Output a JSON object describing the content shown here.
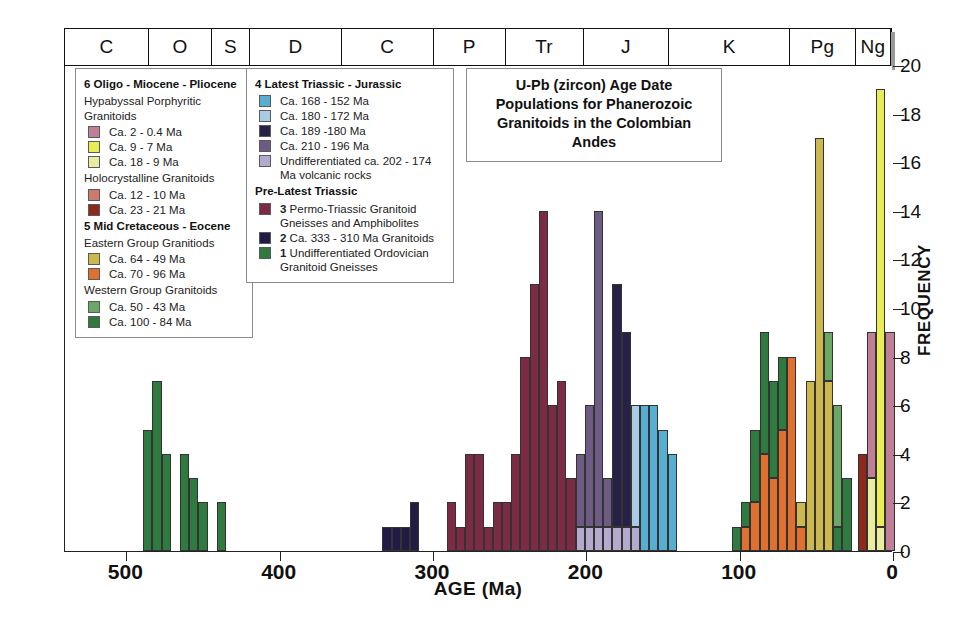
{
  "title": "U-Pb (zircon) Age Date Populations for Phanerozoic Granitoids in the Colombian Andes",
  "axis": {
    "xlabel": "AGE (Ma)",
    "ylabel": "FREQUENCY",
    "xticks": [
      500,
      400,
      300,
      200,
      100,
      0
    ],
    "yticks": [
      0,
      2,
      4,
      6,
      8,
      10,
      12,
      14,
      16,
      18,
      20
    ],
    "xlim": [
      540,
      0
    ],
    "ylim": [
      0,
      20
    ]
  },
  "timescale": {
    "periods": [
      {
        "label": "C",
        "start": 541,
        "end": 485
      },
      {
        "label": "O",
        "start": 485,
        "end": 444
      },
      {
        "label": "S",
        "start": 444,
        "end": 419
      },
      {
        "label": "D",
        "start": 419,
        "end": 359
      },
      {
        "label": "C",
        "start": 359,
        "end": 299
      },
      {
        "label": "P",
        "start": 299,
        "end": 252
      },
      {
        "label": "Tr",
        "start": 252,
        "end": 201
      },
      {
        "label": "J",
        "start": 201,
        "end": 145
      },
      {
        "label": "K",
        "start": 145,
        "end": 66
      },
      {
        "label": "Pg",
        "start": 66,
        "end": 23
      },
      {
        "label": "Ng",
        "start": 23,
        "end": 0
      }
    ]
  },
  "colors": {
    "pink_mauve": "#c07f96",
    "yellow_bright": "#e8ec55",
    "yellow_pale": "#e9eda0",
    "salmon": "#cc7a6c",
    "dark_red": "#8e2a1c",
    "khaki": "#ccb84e",
    "orange": "#e0702f",
    "green_light": "#6aa866",
    "green_dark": "#2f7a3e",
    "blue_mid": "#57aed0",
    "blue_pale": "#a9cbe4",
    "navy_dark": "#272148",
    "purple_mid": "#6e5b83",
    "lavender": "#b4aacd",
    "maroon": "#7d2a44",
    "navy_deep": "#211b45",
    "green_forest": "#2f7a3e"
  },
  "legend_left": {
    "groups": [
      {
        "head": "6 Oligo - Miocene - Pliocene",
        "subgroups": [
          {
            "sub": "Hypabyssal Porphyritic Granitoids",
            "items": [
              {
                "label": "Ca. 2 - 0.4 Ma",
                "color": "#c07f96"
              },
              {
                "label": "Ca. 9 - 7 Ma",
                "color": "#e8ec55"
              },
              {
                "label": "Ca. 18 - 9 Ma",
                "color": "#e9eda0"
              }
            ]
          },
          {
            "sub": "Holocrystalline Granitoids",
            "items": [
              {
                "label": "Ca. 12 - 10 Ma",
                "color": "#cc7a6c"
              },
              {
                "label": "Ca. 23 - 21 Ma",
                "color": "#8e2a1c"
              }
            ]
          }
        ]
      },
      {
        "head": "5 Mid Cretaceous - Eocene",
        "subgroups": [
          {
            "sub": "Eastern Group Granitiods",
            "items": [
              {
                "label": "Ca. 64 - 49 Ma",
                "color": "#ccb84e"
              },
              {
                "label": "Ca. 70 - 96 Ma",
                "color": "#e0702f"
              }
            ]
          },
          {
            "sub": "Western Group Granitoids",
            "items": [
              {
                "label": "Ca. 50 - 43 Ma",
                "color": "#6aa866"
              },
              {
                "label": "Ca. 100 - 84 Ma",
                "color": "#2f7a3e"
              }
            ]
          }
        ]
      }
    ]
  },
  "legend_right": {
    "groups": [
      {
        "head": "4 Latest Triassic - Jurassic",
        "subgroups": [
          {
            "sub": "",
            "items": [
              {
                "label": "Ca. 168 - 152 Ma",
                "color": "#57aed0"
              },
              {
                "label": "Ca. 180 - 172 Ma",
                "color": "#a9cbe4"
              },
              {
                "label": "Ca. 189 -180 Ma",
                "color": "#272148"
              },
              {
                "label": "Ca. 210 - 196 Ma",
                "color": "#6e5b83"
              },
              {
                "label": "Undifferentiated ca. 202 - 174 Ma volcanic rocks",
                "color": "#b4aacd"
              }
            ]
          }
        ]
      },
      {
        "head": "Pre-Latest Triassic",
        "subgroups": [
          {
            "sub": "",
            "items": [
              {
                "label": "3 Permo-Triassic Granitoid Gneisses and Amphibolites",
                "color": "#7d2a44",
                "num": "3"
              },
              {
                "label": "2 Ca. 333 - 310 Ma Granitoids",
                "color": "#211b45",
                "num": "2"
              },
              {
                "label": "1 Undifferentiated Ordovician Granitoid Gneisses",
                "color": "#2f7a3e",
                "num": "1"
              }
            ]
          }
        ]
      }
    ]
  },
  "chart_data": {
    "type": "bar",
    "title": "U-Pb (zircon) Age Date Populations for Phanerozoic Granitoids in the Colombian Andes",
    "xlabel": "AGE (Ma)",
    "ylabel": "FREQUENCY",
    "xlim": [
      540,
      0
    ],
    "ylim": [
      0,
      20
    ],
    "grid": false,
    "orientation": "x-reversed",
    "bin_width_ma": 6,
    "legend_position": "inside-upper-left",
    "note": "Stacked histogram; each bar is one age bin with colored segments by granitoid population.",
    "bars": [
      {
        "age": 486,
        "segments": [
          {
            "color": "#2f7a3e",
            "value": 5
          }
        ]
      },
      {
        "age": 480,
        "segments": [
          {
            "color": "#2f7a3e",
            "value": 7
          }
        ]
      },
      {
        "age": 474,
        "segments": [
          {
            "color": "#2f7a3e",
            "value": 4
          }
        ]
      },
      {
        "age": 462,
        "segments": [
          {
            "color": "#2f7a3e",
            "value": 4
          }
        ]
      },
      {
        "age": 456,
        "segments": [
          {
            "color": "#2f7a3e",
            "value": 3
          }
        ]
      },
      {
        "age": 450,
        "segments": [
          {
            "color": "#2f7a3e",
            "value": 2
          }
        ]
      },
      {
        "age": 438,
        "segments": [
          {
            "color": "#2f7a3e",
            "value": 2
          }
        ]
      },
      {
        "age": 330,
        "segments": [
          {
            "color": "#211b45",
            "value": 1
          }
        ]
      },
      {
        "age": 324,
        "segments": [
          {
            "color": "#211b45",
            "value": 1
          }
        ]
      },
      {
        "age": 318,
        "segments": [
          {
            "color": "#211b45",
            "value": 1
          }
        ]
      },
      {
        "age": 312,
        "segments": [
          {
            "color": "#211b45",
            "value": 2
          }
        ]
      },
      {
        "age": 288,
        "segments": [
          {
            "color": "#7d2a44",
            "value": 2
          }
        ]
      },
      {
        "age": 282,
        "segments": [
          {
            "color": "#7d2a44",
            "value": 1
          }
        ]
      },
      {
        "age": 276,
        "segments": [
          {
            "color": "#7d2a44",
            "value": 4
          }
        ]
      },
      {
        "age": 270,
        "segments": [
          {
            "color": "#7d2a44",
            "value": 4
          }
        ]
      },
      {
        "age": 264,
        "segments": [
          {
            "color": "#7d2a44",
            "value": 1
          }
        ]
      },
      {
        "age": 258,
        "segments": [
          {
            "color": "#7d2a44",
            "value": 2
          }
        ]
      },
      {
        "age": 252,
        "segments": [
          {
            "color": "#7d2a44",
            "value": 2
          }
        ]
      },
      {
        "age": 246,
        "segments": [
          {
            "color": "#7d2a44",
            "value": 4
          }
        ]
      },
      {
        "age": 240,
        "segments": [
          {
            "color": "#7d2a44",
            "value": 8
          }
        ]
      },
      {
        "age": 234,
        "segments": [
          {
            "color": "#7d2a44",
            "value": 11
          }
        ]
      },
      {
        "age": 228,
        "segments": [
          {
            "color": "#7d2a44",
            "value": 14
          }
        ]
      },
      {
        "age": 222,
        "segments": [
          {
            "color": "#7d2a44",
            "value": 6
          }
        ]
      },
      {
        "age": 216,
        "segments": [
          {
            "color": "#7d2a44",
            "value": 7
          }
        ]
      },
      {
        "age": 210,
        "segments": [
          {
            "color": "#7d2a44",
            "value": 3
          }
        ]
      },
      {
        "age": 204,
        "segments": [
          {
            "color": "#b4aacd",
            "value": 1
          },
          {
            "color": "#6e5b83",
            "value": 3
          }
        ]
      },
      {
        "age": 198,
        "segments": [
          {
            "color": "#b4aacd",
            "value": 1
          },
          {
            "color": "#6e5b83",
            "value": 5
          }
        ]
      },
      {
        "age": 192,
        "segments": [
          {
            "color": "#b4aacd",
            "value": 1
          },
          {
            "color": "#6e5b83",
            "value": 13
          }
        ]
      },
      {
        "age": 186,
        "segments": [
          {
            "color": "#b4aacd",
            "value": 1
          },
          {
            "color": "#6e5b83",
            "value": 2
          }
        ]
      },
      {
        "age": 180,
        "segments": [
          {
            "color": "#b4aacd",
            "value": 1
          },
          {
            "color": "#272148",
            "value": 10
          }
        ]
      },
      {
        "age": 174,
        "segments": [
          {
            "color": "#b4aacd",
            "value": 1
          },
          {
            "color": "#272148",
            "value": 8
          }
        ]
      },
      {
        "age": 168,
        "segments": [
          {
            "color": "#b4aacd",
            "value": 1
          },
          {
            "color": "#a9cbe4",
            "value": 5
          }
        ]
      },
      {
        "age": 162,
        "segments": [
          {
            "color": "#57aed0",
            "value": 6
          }
        ]
      },
      {
        "age": 156,
        "segments": [
          {
            "color": "#57aed0",
            "value": 6
          }
        ]
      },
      {
        "age": 150,
        "segments": [
          {
            "color": "#57aed0",
            "value": 5
          }
        ]
      },
      {
        "age": 144,
        "segments": [
          {
            "color": "#57aed0",
            "value": 4
          }
        ]
      },
      {
        "age": 102,
        "segments": [
          {
            "color": "#2f7a3e",
            "value": 1
          }
        ]
      },
      {
        "age": 96,
        "segments": [
          {
            "color": "#e0702f",
            "value": 1
          },
          {
            "color": "#2f7a3e",
            "value": 1
          }
        ]
      },
      {
        "age": 90,
        "segments": [
          {
            "color": "#e0702f",
            "value": 2
          },
          {
            "color": "#2f7a3e",
            "value": 3
          }
        ]
      },
      {
        "age": 84,
        "segments": [
          {
            "color": "#e0702f",
            "value": 4
          },
          {
            "color": "#2f7a3e",
            "value": 5
          }
        ]
      },
      {
        "age": 78,
        "segments": [
          {
            "color": "#e0702f",
            "value": 3
          },
          {
            "color": "#2f7a3e",
            "value": 4
          }
        ]
      },
      {
        "age": 72,
        "segments": [
          {
            "color": "#e0702f",
            "value": 5
          },
          {
            "color": "#2f7a3e",
            "value": 3
          }
        ]
      },
      {
        "age": 66,
        "segments": [
          {
            "color": "#e0702f",
            "value": 8
          }
        ]
      },
      {
        "age": 60,
        "segments": [
          {
            "color": "#e0702f",
            "value": 1
          },
          {
            "color": "#ccb84e",
            "value": 1
          }
        ]
      },
      {
        "age": 54,
        "segments": [
          {
            "color": "#ccb84e",
            "value": 7
          }
        ]
      },
      {
        "age": 48,
        "segments": [
          {
            "color": "#ccb84e",
            "value": 17
          }
        ]
      },
      {
        "age": 42,
        "segments": [
          {
            "color": "#ccb84e",
            "value": 7
          },
          {
            "color": "#6aa866",
            "value": 2
          }
        ]
      },
      {
        "age": 36,
        "segments": [
          {
            "color": "#2f7a3e",
            "value": 1
          },
          {
            "color": "#6aa866",
            "value": 5
          }
        ]
      },
      {
        "age": 30,
        "segments": [
          {
            "color": "#2f7a3e",
            "value": 3
          }
        ]
      },
      {
        "age": 20,
        "segments": [
          {
            "color": "#8e2a1c",
            "value": 4
          }
        ]
      },
      {
        "age": 14,
        "segments": [
          {
            "color": "#e9eda0",
            "value": 3
          },
          {
            "color": "#c07f96",
            "value": 6
          }
        ]
      },
      {
        "age": 8,
        "segments": [
          {
            "color": "#e9eda0",
            "value": 1
          },
          {
            "color": "#e8ec55",
            "value": 18
          }
        ]
      },
      {
        "age": 2,
        "segments": [
          {
            "color": "#c07f96",
            "value": 9
          }
        ]
      }
    ]
  }
}
